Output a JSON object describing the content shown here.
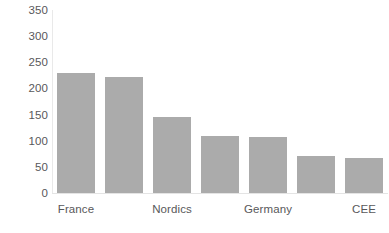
{
  "chart_data": {
    "type": "bar",
    "title": "",
    "subtitle": "",
    "xlabel": "",
    "ylabel": "",
    "categories": [
      "France",
      "",
      "Nordics",
      "",
      "Germany",
      "",
      "CEE"
    ],
    "values": [
      230,
      222,
      145,
      110,
      108,
      70,
      67
    ],
    "ylim": [
      0,
      350
    ],
    "yticks": [
      0,
      50,
      100,
      150,
      200,
      250,
      300,
      350
    ],
    "ytick_labels": [
      "0",
      "50",
      "100",
      "150",
      "200",
      "250",
      "300",
      "350"
    ],
    "visible_xtick_labels": [
      "France",
      "Nordics",
      "Germany",
      "CEE"
    ],
    "grid": false,
    "legend": null,
    "bar_color": "#ababab",
    "axis_color": "#e6e6e6",
    "tick_label_color": "#58585a"
  }
}
